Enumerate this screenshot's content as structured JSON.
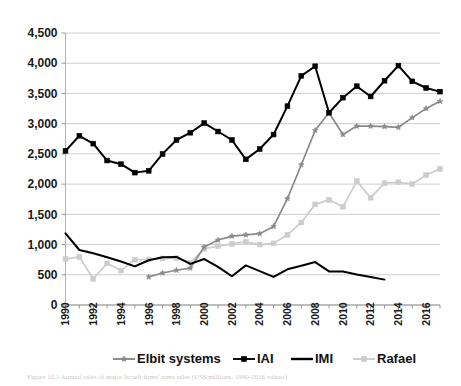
{
  "figure": {
    "caption": "Figure 10.1 Annual sales of major Israeli firms' arms sales (US$ millions, 1990-2016 values)"
  },
  "legend": {
    "position": "bottom",
    "items": [
      {
        "label": "Elbit systems",
        "color": "#888888",
        "marker": "star"
      },
      {
        "label": "IAI",
        "color": "#000000",
        "marker": "square"
      },
      {
        "label": "IMI",
        "color": "#000000",
        "marker": "none"
      },
      {
        "label": "Rafael",
        "color": "#cccccc",
        "marker": "square"
      }
    ]
  },
  "chart_data": {
    "type": "line",
    "title": "",
    "xlabel": "",
    "ylabel": "",
    "grid": true,
    "ylim": [
      0,
      4500
    ],
    "xlim": [
      1990,
      2017
    ],
    "y_ticks": [
      "0",
      "500",
      "1,000",
      "1,500",
      "2,000",
      "2,500",
      "3,000",
      "3,500",
      "4,000",
      "4,500"
    ],
    "y_tick_values": [
      0,
      500,
      1000,
      1500,
      2000,
      2500,
      3000,
      3500,
      4000,
      4500
    ],
    "x_tick_labels": [
      "1990",
      "1992",
      "1994",
      "1996",
      "1998",
      "2000",
      "2002",
      "2004",
      "2006",
      "2008",
      "2010",
      "2012",
      "2014",
      "2016"
    ],
    "x_tick_values": [
      1990,
      1992,
      1994,
      1996,
      1998,
      2000,
      2002,
      2004,
      2006,
      2008,
      2010,
      2012,
      2014,
      2016
    ],
    "x": [
      1990,
      1991,
      1992,
      1993,
      1994,
      1995,
      1996,
      1997,
      1998,
      1999,
      2000,
      2001,
      2002,
      2003,
      2004,
      2005,
      2006,
      2007,
      2008,
      2009,
      2010,
      2011,
      2012,
      2013,
      2014,
      2015,
      2016,
      2017
    ],
    "series": [
      {
        "name": "Elbit systems",
        "color": "#8a8a8a",
        "marker": "star",
        "x": [
          1996,
          1997,
          1998,
          1999,
          2000,
          2001,
          2002,
          2003,
          2004,
          2005,
          2006,
          2007,
          2008,
          2009,
          2010,
          2011,
          2012,
          2013,
          2014,
          2015,
          2016,
          2017
        ],
        "values": [
          465,
          530,
          575,
          610,
          960,
          1075,
          1140,
          1160,
          1180,
          1300,
          1760,
          2320,
          2890,
          3180,
          2820,
          2960,
          2960,
          2950,
          2940,
          3100,
          3250,
          3370
        ]
      },
      {
        "name": "IAI",
        "color": "#000000",
        "marker": "square",
        "x": [
          1990,
          1991,
          1992,
          1993,
          1994,
          1995,
          1996,
          1997,
          1998,
          1999,
          2000,
          2001,
          2002,
          2003,
          2004,
          2005,
          2006,
          2007,
          2008,
          2009,
          2010,
          2011,
          2012,
          2013,
          2014,
          2015,
          2016,
          2017
        ],
        "values": [
          2550,
          2800,
          2670,
          2390,
          2330,
          2190,
          2220,
          2500,
          2730,
          2850,
          3010,
          2870,
          2730,
          2410,
          2580,
          2820,
          3290,
          3790,
          3950,
          3180,
          3430,
          3620,
          3450,
          3710,
          3960,
          3700,
          3590,
          3530
        ]
      },
      {
        "name": "IMI",
        "color": "#000000",
        "marker": "none",
        "x": [
          1990,
          1991,
          1992,
          1993,
          1994,
          1995,
          1996,
          1997,
          1998,
          1999,
          2000,
          2001,
          2002,
          2003,
          2004,
          2005,
          2006,
          2007,
          2008,
          2009,
          2010,
          2011,
          2012,
          2013
        ],
        "values": [
          1185,
          910,
          855,
          790,
          720,
          640,
          740,
          790,
          795,
          680,
          760,
          630,
          475,
          655,
          560,
          465,
          590,
          650,
          710,
          555,
          555,
          505,
          465,
          420
        ]
      },
      {
        "name": "Rafael",
        "color": "#cccccc",
        "marker": "square",
        "x": [
          1990,
          1991,
          1992,
          1993,
          1994,
          1995,
          1996,
          1997,
          1998,
          1999,
          2000,
          2001,
          2002,
          2003,
          2004,
          2005,
          2006,
          2007,
          2008,
          2009,
          2010,
          2011,
          2012,
          2013,
          2014,
          2015,
          2016,
          2017
        ],
        "values": [
          760,
          795,
          430,
          690,
          570,
          750,
          755,
          770,
          775,
          700,
          930,
          975,
          1010,
          1045,
          1000,
          1020,
          1160,
          1365,
          1665,
          1740,
          1625,
          2050,
          1775,
          2015,
          2030,
          2000,
          2150,
          2250
        ]
      }
    ]
  }
}
